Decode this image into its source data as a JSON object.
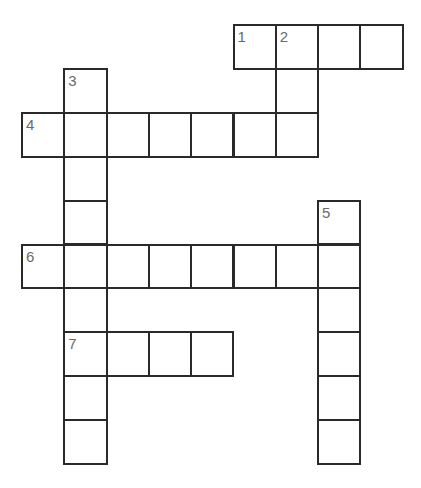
{
  "puzzle": {
    "type": "crossword",
    "grid": {
      "origin_x": 22,
      "origin_y": 25,
      "cell_w": 42.3,
      "cell_h": 43.9,
      "line_color": "#2a2a2a",
      "number_color": "#6a6a6a"
    },
    "entries": [
      {
        "number": "1",
        "direction": "across",
        "row": 0,
        "col": 5,
        "length": 4
      },
      {
        "number": "2",
        "direction": "down",
        "row": 0,
        "col": 6,
        "length": 3
      },
      {
        "number": "3",
        "direction": "down",
        "row": 1,
        "col": 1,
        "length": 9
      },
      {
        "number": "4",
        "direction": "across",
        "row": 2,
        "col": 0,
        "length": 7
      },
      {
        "number": "5",
        "direction": "down",
        "row": 4,
        "col": 7,
        "length": 6
      },
      {
        "number": "6",
        "direction": "across",
        "row": 5,
        "col": 0,
        "length": 8
      },
      {
        "number": "7",
        "direction": "across",
        "row": 7,
        "col": 1,
        "length": 4
      }
    ]
  }
}
